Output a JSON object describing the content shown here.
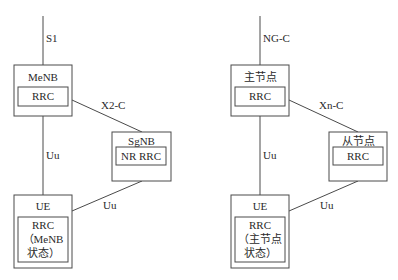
{
  "left_diagram": {
    "core_link_label": "S1",
    "master": {
      "title": "MeNB",
      "inner": "RRC"
    },
    "inter_node_link_label": "X2-C",
    "secondary": {
      "title": "SgNB",
      "inner": "NR RRC"
    },
    "ue_master_link_label": "Uu",
    "ue_secondary_link_label": "Uu",
    "ue": {
      "title": "UE",
      "inner_line1": "RRC",
      "inner_line2": "（MeNB",
      "inner_line3": "状态）"
    }
  },
  "right_diagram": {
    "core_link_label": "NG-C",
    "master": {
      "title": "主节点",
      "inner": "RRC"
    },
    "inter_node_link_label": "Xn-C",
    "secondary": {
      "title": "从节点",
      "inner": "RRC"
    },
    "ue_master_link_label": "Uu",
    "ue_secondary_link_label": "Uu",
    "ue": {
      "title": "UE",
      "inner_line1": "RRC",
      "inner_line2": "（主节点",
      "inner_line3": "状态）"
    }
  },
  "colors": {
    "line": "#4a4a4a",
    "text": "#2a2a2a",
    "background": "#ffffff"
  }
}
